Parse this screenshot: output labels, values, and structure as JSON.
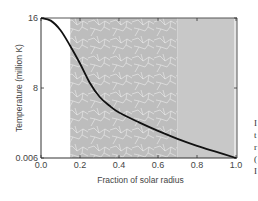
{
  "chart_data": {
    "type": "line",
    "title": "",
    "xlabel": "Fraction of solar radius",
    "ylabel": "Temperature (million K)",
    "xlim": [
      0.0,
      1.0
    ],
    "ylim": [
      0.006,
      16
    ],
    "x_ticks": [
      "0.0",
      "0.2",
      "0.4",
      "0.6",
      "0.8",
      "1.0"
    ],
    "x_tick_values": [
      0.0,
      0.2,
      0.4,
      0.6,
      0.8,
      1.0
    ],
    "y_ticks": [
      "0.006",
      "8",
      "16"
    ],
    "y_tick_values": [
      0.006,
      8,
      16
    ],
    "grid": false,
    "regions": [
      {
        "name": "radiative-zone",
        "x_start": 0.15,
        "x_end": 0.7,
        "color": "#bdbdbd",
        "texture": "light-paths"
      },
      {
        "name": "convective-zone",
        "x_start": 0.7,
        "x_end": 1.0,
        "color": "#c8c8c8",
        "texture": "none"
      }
    ],
    "series": [
      {
        "name": "Temperature",
        "color": "#111111",
        "x": [
          0.0,
          0.05,
          0.1,
          0.15,
          0.2,
          0.25,
          0.3,
          0.35,
          0.4,
          0.5,
          0.6,
          0.7,
          0.8,
          0.9,
          1.0
        ],
        "y": [
          16,
          15.7,
          14.6,
          12.8,
          10.8,
          8.6,
          7.0,
          6.0,
          5.2,
          4.1,
          3.1,
          2.2,
          1.4,
          0.7,
          0.006
        ]
      }
    ]
  },
  "side_text_fragments": [
    "I",
    "t",
    "r",
    "(",
    "I"
  ]
}
